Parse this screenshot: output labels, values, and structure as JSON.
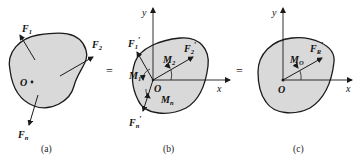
{
  "figures": [
    {
      "id": "a",
      "caption": "(a)",
      "origin_label": "O",
      "forces": [
        {
          "name": "F",
          "sub": "1",
          "prime": ""
        },
        {
          "name": "F",
          "sub": "2",
          "prime": ""
        },
        {
          "name": "F",
          "sub": "n",
          "prime": ""
        }
      ]
    },
    {
      "id": "b",
      "caption": "(b)",
      "origin_label": "O",
      "x_axis": "x",
      "y_axis": "y",
      "forces": [
        {
          "name": "F",
          "sub": "1",
          "prime": "′"
        },
        {
          "name": "F",
          "sub": "2",
          "prime": "′"
        },
        {
          "name": "F",
          "sub": "n",
          "prime": "′"
        }
      ],
      "moments": [
        {
          "name": "M",
          "sub": "1"
        },
        {
          "name": "M",
          "sub": "2"
        },
        {
          "name": "M",
          "sub": "n"
        }
      ]
    },
    {
      "id": "c",
      "caption": "(c)",
      "origin_label": "O",
      "x_axis": "x",
      "y_axis": "y",
      "forces": [
        {
          "name": "F",
          "sub": "R",
          "prime": "′"
        }
      ],
      "moments": [
        {
          "name": "M",
          "sub": "O"
        }
      ]
    }
  ],
  "equals_signs": [
    "=",
    "="
  ],
  "colors": {
    "body_fill": "#d9d9d9",
    "stroke": "#1a1a1a"
  }
}
